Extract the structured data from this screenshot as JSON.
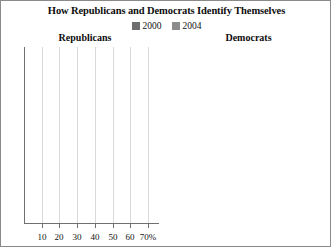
{
  "title": "How Republicans and Democrats Identify Themselves",
  "legend": {
    "position": "top-center",
    "items": [
      {
        "label": "2000",
        "color": "#6e6e6e"
      },
      {
        "label": "2004",
        "color": "#8c8c8c"
      }
    ]
  },
  "axis": {
    "ticks": [
      "10",
      "20",
      "30",
      "40",
      "50",
      "60",
      "70%"
    ],
    "tick_values": [
      10,
      20,
      30,
      40,
      50,
      60,
      70
    ],
    "xlim": [
      0,
      75
    ],
    "grid": true
  },
  "panels": [
    {
      "title": "Republicans",
      "categories": [
        "Conservative",
        "Moderate",
        "Liberal"
      ],
      "values_2000": [
        "61%",
        "33%",
        "6%"
      ],
      "values_2004": [
        "67%",
        "28%",
        "5%"
      ]
    },
    {
      "title": "Democrats",
      "categories": [
        "Conservative",
        "Moderate",
        "Liberal"
      ],
      "values_2000": [
        "24%",
        "47%",
        "29%"
      ],
      "values_2004": [
        "23%",
        "44%",
        "33%"
      ]
    }
  ],
  "chart_data": {
    "type": "bar",
    "title": "How Republicans and Democrats Identify Themselves",
    "orientation": "horizontal",
    "xlabel": "",
    "ylabel": "",
    "xlim": [
      0,
      75
    ],
    "xticks": [
      10,
      20,
      30,
      40,
      50,
      60,
      70
    ],
    "xtick_labels": [
      "10",
      "20",
      "30",
      "40",
      "50",
      "60",
      "70%"
    ],
    "grid": true,
    "legend": [
      "2000",
      "2004"
    ],
    "legend_position": "top-center",
    "panels": [
      {
        "name": "Republicans",
        "categories": [
          "Conservative",
          "Moderate",
          "Liberal"
        ],
        "series": [
          {
            "name": "2000",
            "values": [
              61,
              33,
              6
            ],
            "color": "#6e6e6e"
          },
          {
            "name": "2004",
            "values": [
              67,
              28,
              5
            ],
            "color": "#8c8c8c"
          }
        ]
      },
      {
        "name": "Democrats",
        "categories": [
          "Conservative",
          "Moderate",
          "Liberal"
        ],
        "series": [
          {
            "name": "2000",
            "values": [
              24,
              47,
              29
            ],
            "color": "#6e6e6e"
          },
          {
            "name": "2004",
            "values": [
              23,
              44,
              33
            ],
            "color": "#8c8c8c"
          }
        ]
      }
    ],
    "units": "percent"
  }
}
